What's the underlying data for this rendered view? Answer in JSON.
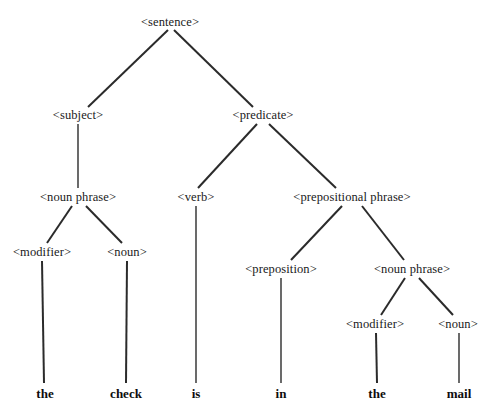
{
  "figure": {
    "kind": "parse-tree-diagram",
    "sentence": "the check is in the mail",
    "line_color": "#2b2b2b",
    "text_color": "#1a1a1a",
    "background": "#ffffff"
  },
  "nodes": {
    "sentence": {
      "label": "<sentence>",
      "x": 170,
      "y": 22
    },
    "subject": {
      "label": "<subject>",
      "x": 78,
      "y": 115
    },
    "predicate": {
      "label": "<predicate>",
      "x": 263,
      "y": 115
    },
    "noun_phrase_left": {
      "label": "<noun phrase>",
      "x": 78,
      "y": 197
    },
    "verb": {
      "label": "<verb>",
      "x": 196,
      "y": 197
    },
    "prepositional_phrase": {
      "label": "<prepositional phrase>",
      "x": 352,
      "y": 197
    },
    "modifier_left": {
      "label": "<modifier>",
      "x": 42,
      "y": 252
    },
    "noun_left": {
      "label": "<noun>",
      "x": 127,
      "y": 252
    },
    "preposition": {
      "label": "<preposition>",
      "x": 281,
      "y": 269
    },
    "noun_phrase_right": {
      "label": "<noun phrase>",
      "x": 412,
      "y": 269
    },
    "modifier_right": {
      "label": "<modifier>",
      "x": 375,
      "y": 324
    },
    "noun_right": {
      "label": "<noun>",
      "x": 458,
      "y": 324
    }
  },
  "leaves": [
    {
      "name": "leaf-the-1",
      "label": "the",
      "x": 45,
      "y": 393
    },
    {
      "name": "leaf-check",
      "label": "check",
      "x": 126,
      "y": 393
    },
    {
      "name": "leaf-is",
      "label": "is",
      "x": 196,
      "y": 393
    },
    {
      "name": "leaf-in",
      "label": "in",
      "x": 281,
      "y": 393
    },
    {
      "name": "leaf-the-2",
      "label": "the",
      "x": 377,
      "y": 393
    },
    {
      "name": "leaf-mail",
      "label": "mail",
      "x": 459,
      "y": 393
    }
  ],
  "edges": [
    {
      "name": "edge-sentence-subject",
      "x1": 168,
      "y1": 30,
      "x2": 88,
      "y2": 107
    },
    {
      "name": "edge-sentence-predicate",
      "x1": 174,
      "y1": 30,
      "x2": 253,
      "y2": 107
    },
    {
      "name": "edge-subject-nounphrase",
      "x1": 78,
      "y1": 124,
      "x2": 78,
      "y2": 188
    },
    {
      "name": "edge-predicate-verb",
      "x1": 257,
      "y1": 124,
      "x2": 198,
      "y2": 188
    },
    {
      "name": "edge-predicate-prepphrase",
      "x1": 269,
      "y1": 124,
      "x2": 336,
      "y2": 188
    },
    {
      "name": "edge-nounphrase-modifier",
      "x1": 72,
      "y1": 206,
      "x2": 47,
      "y2": 243
    },
    {
      "name": "edge-nounphrase-noun",
      "x1": 86,
      "y1": 206,
      "x2": 122,
      "y2": 243
    },
    {
      "name": "edge-verb-is",
      "x1": 196,
      "y1": 206,
      "x2": 196,
      "y2": 383
    },
    {
      "name": "edge-prepphrase-preposition",
      "x1": 342,
      "y1": 206,
      "x2": 291,
      "y2": 260
    },
    {
      "name": "edge-prepphrase-nounphrase",
      "x1": 362,
      "y1": 206,
      "x2": 404,
      "y2": 260
    },
    {
      "name": "edge-modifier-the-1",
      "x1": 42,
      "y1": 261,
      "x2": 44,
      "y2": 383
    },
    {
      "name": "edge-noun-check",
      "x1": 127,
      "y1": 261,
      "x2": 126,
      "y2": 383
    },
    {
      "name": "edge-preposition-in",
      "x1": 281,
      "y1": 278,
      "x2": 281,
      "y2": 383
    },
    {
      "name": "edge-nounphrase2-modifier",
      "x1": 405,
      "y1": 278,
      "x2": 381,
      "y2": 315
    },
    {
      "name": "edge-nounphrase2-noun",
      "x1": 419,
      "y1": 278,
      "x2": 453,
      "y2": 315
    },
    {
      "name": "edge-modifier2-the-2",
      "x1": 376,
      "y1": 333,
      "x2": 377,
      "y2": 383
    },
    {
      "name": "edge-noun2-mail",
      "x1": 459,
      "y1": 333,
      "x2": 459,
      "y2": 383
    }
  ]
}
